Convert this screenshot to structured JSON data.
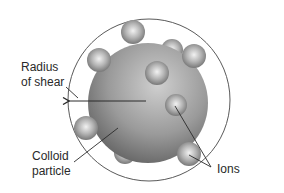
{
  "diagram": {
    "labels": {
      "radius_line1": "Radius",
      "radius_line2": "of shear",
      "colloid_line1": "Colloid",
      "colloid_line2": "particle",
      "ions": "Ions"
    },
    "ion_count": 9,
    "colors": {
      "background": "#ffffff",
      "shear_circle": "#5a5a5a",
      "particle_light": "#c8c8c8",
      "particle_dark": "#5e5e5e",
      "ion_light": "#f0f0f0",
      "ion_dark": "#6a6a6a",
      "leader_line": "#2a2a2a"
    }
  }
}
